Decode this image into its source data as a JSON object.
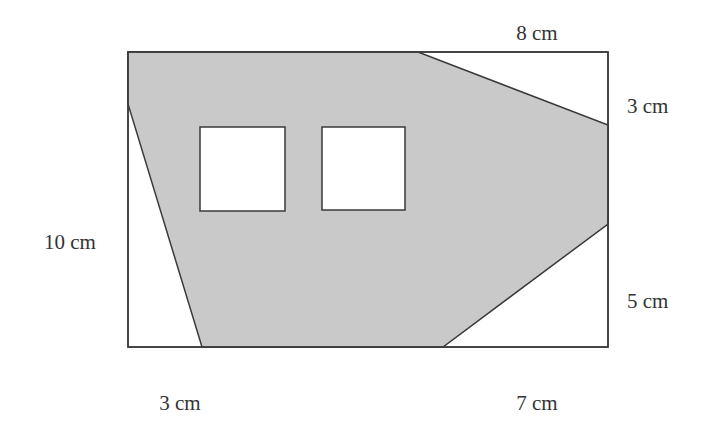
{
  "diagram": {
    "type": "geometry-shaded-area",
    "colors": {
      "shaded": "#c9c9c9",
      "stroke": "#3a3a3a",
      "background": "#ffffff",
      "hole": "#ffffff",
      "text": "#333333"
    },
    "rectangle": {
      "x": 128,
      "y": 52,
      "width": 480,
      "height": 295
    },
    "shaded_polygon": [
      [
        128,
        52
      ],
      [
        418,
        52
      ],
      [
        608,
        125
      ],
      [
        608,
        224
      ],
      [
        443,
        347
      ],
      [
        202,
        347
      ],
      [
        128,
        104
      ]
    ],
    "holes": [
      {
        "name": "square-left",
        "x": 200,
        "y": 127,
        "width": 85,
        "height": 84
      },
      {
        "name": "square-right",
        "x": 322,
        "y": 127,
        "width": 83,
        "height": 83
      }
    ],
    "labels": {
      "top": "8 cm",
      "right_upper": "3 cm",
      "right_lower": "5 cm",
      "left": "10 cm",
      "bottom_left": "3 cm",
      "bottom_right": "7 cm"
    }
  }
}
